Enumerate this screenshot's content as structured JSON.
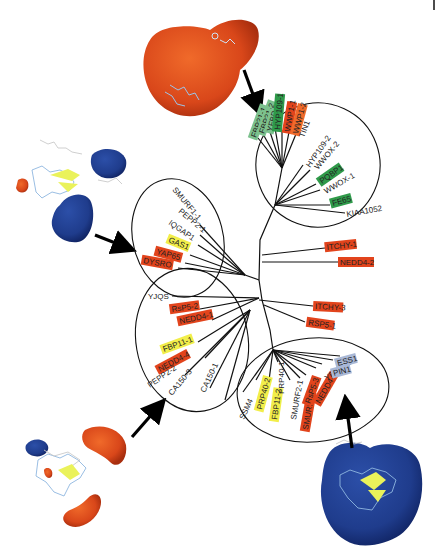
{
  "figure": {
    "type": "unrooted phylogenetic tree of WW domains with electrostatic surface structures",
    "colors": {
      "red": "#e2441c",
      "orange": "#f06a2a",
      "yellow": "#f2ee4a",
      "green": "#2f9a4a",
      "light_green": "#7cc18e",
      "blue_grey": "#a9b8d6",
      "negative_surface": "#1f3c8c",
      "positive_surface": "#d9471a"
    },
    "clusters": {
      "top_right": {
        "labels": [
          {
            "text": "FBP21-1",
            "color": "light_green"
          },
          {
            "text": "FBP21-2",
            "color": "light_green"
          },
          {
            "text": "YFBD",
            "color": "light_green"
          },
          {
            "text": "HYP109-1",
            "color": "green"
          },
          {
            "text": "WWP1-1",
            "color": "red"
          },
          {
            "text": "WWP1-2",
            "color": "orange"
          },
          {
            "text": "TIN1",
            "color": "none"
          },
          {
            "text": "HYP109-2",
            "color": "none"
          },
          {
            "text": "WWOX-2",
            "color": "none"
          },
          {
            "text": "PQBP1",
            "color": "green"
          },
          {
            "text": "WWOX-1",
            "color": "none"
          },
          {
            "text": "FE65",
            "color": "green"
          },
          {
            "text": "KIAA1052",
            "color": "none"
          }
        ]
      },
      "left_upper": {
        "labels": [
          {
            "text": "SMURF1-1",
            "color": "none"
          },
          {
            "text": "PEPP2-1",
            "color": "none"
          },
          {
            "text": "IQGAP1",
            "color": "none"
          },
          {
            "text": "GAS1",
            "color": "yellow"
          },
          {
            "text": "YAP65",
            "color": "red"
          },
          {
            "text": "DYSRO",
            "color": "red"
          }
        ]
      },
      "left_lower": {
        "labels": [
          {
            "text": "YJQS",
            "color": "none"
          },
          {
            "text": "RsP5-2",
            "color": "red"
          },
          {
            "text": "NEDD4-1",
            "color": "red"
          },
          {
            "text": "FBP11-1",
            "color": "yellow"
          },
          {
            "text": "NEDD4-4",
            "color": "red"
          },
          {
            "text": "PEPP2-2",
            "color": "none"
          },
          {
            "text": "CA150-3",
            "color": "none"
          },
          {
            "text": "CA150-1",
            "color": "none"
          }
        ]
      },
      "bottom_right": {
        "labels": [
          {
            "text": "SSM4",
            "color": "none"
          },
          {
            "text": "PRP40-2",
            "color": "yellow"
          },
          {
            "text": "FBP11-2",
            "color": "yellow"
          },
          {
            "text": "PRP40-1",
            "color": "none"
          },
          {
            "text": "SMURF2-1",
            "color": "none"
          },
          {
            "text": "SMURF1-2",
            "color": "red"
          },
          {
            "text": "RsP5-3",
            "color": "red"
          },
          {
            "text": "NEDD4-3",
            "color": "red"
          },
          {
            "text": "YPR152C",
            "color": "none"
          },
          {
            "text": "PIN1",
            "color": "blue_grey"
          },
          {
            "text": "ESS1",
            "color": "blue_grey"
          }
        ]
      },
      "unclustered": {
        "labels": [
          {
            "text": "ITCHY-1",
            "color": "red"
          },
          {
            "text": "NEDD4-2",
            "color": "red"
          },
          {
            "text": "ITCHY-3",
            "color": "red"
          },
          {
            "text": "RSP5-1",
            "color": "red"
          }
        ]
      }
    },
    "structures": [
      {
        "position": "top",
        "surface": "mostly positive (red)"
      },
      {
        "position": "left",
        "surface": "mostly negative (blue)"
      },
      {
        "position": "bottom-left",
        "surface": "mixed red/blue"
      },
      {
        "position": "bottom-right",
        "surface": "mostly negative (blue)"
      }
    ]
  }
}
